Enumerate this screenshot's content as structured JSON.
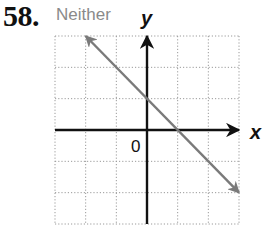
{
  "problem": {
    "number": "58.",
    "answer": "Neither"
  },
  "chart_data": {
    "type": "line",
    "title": "",
    "xlabel": "x",
    "ylabel": "y",
    "origin_label": "0",
    "xlim": [
      -3,
      3
    ],
    "ylim": [
      -3,
      3
    ],
    "grid": true,
    "grid_style": "dotted",
    "series": [
      {
        "name": "y = -x + 1",
        "x": [
          -2,
          3
        ],
        "y": [
          3,
          -2
        ],
        "slope": -1,
        "y_intercept": 1,
        "x_intercept": 1,
        "arrows_both_ends": true,
        "color": "#7a7a7a"
      }
    ]
  },
  "colors": {
    "axis": "#111111",
    "grid": "#9a9a9a",
    "line": "#7a7a7a",
    "answer_text": "#8a8a8a"
  }
}
